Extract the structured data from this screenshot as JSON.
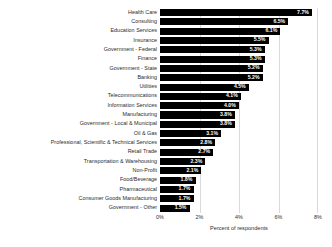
{
  "chart_data": {
    "type": "bar",
    "orientation": "horizontal",
    "title": "",
    "xlabel": "Percent of respondents",
    "ylabel": "",
    "xlim": [
      0,
      8
    ],
    "xticks": [
      "0%",
      "2%",
      "4%",
      "6%",
      "8%"
    ],
    "xtick_values": [
      0,
      2,
      4,
      6,
      8
    ],
    "grid": true,
    "grid_axis": "x",
    "legend": false,
    "bar_color": "#000000",
    "value_label_color": "#ffffff",
    "categories": [
      "Health Care",
      "Consulting",
      "Education Services",
      "Insurance",
      "Government - Federal",
      "Finance",
      "Government - State",
      "Banking",
      "Utilities",
      "Telecommunications",
      "Information Services",
      "Manufacturing",
      "Government - Local & Municipal",
      "Oil & Gas",
      "Professional, Scientific & Technical Services",
      "Retail Trade",
      "Transportation & Warehousing",
      "Non-Profit",
      "Food/Beverage",
      "Pharmaceutical",
      "Consumer Goods Manufacturing",
      "Government - Other"
    ],
    "values": [
      7.7,
      6.5,
      6.1,
      5.5,
      5.3,
      5.3,
      5.2,
      5.2,
      4.5,
      4.1,
      4.0,
      3.8,
      3.8,
      3.1,
      2.8,
      2.7,
      2.3,
      2.1,
      1.8,
      1.7,
      1.7,
      1.5
    ],
    "value_labels": [
      "7.7%",
      "6.5%",
      "6.1%",
      "5.5%",
      "5.3%",
      "5.3%",
      "5.2%",
      "5.2%",
      "4.5%",
      "4.1%",
      "4.0%",
      "3.8%",
      "3.8%",
      "3.1%",
      "2.8%",
      "2.7%",
      "2.3%",
      "2.1%",
      "1.8%",
      "1.7%",
      "1.7%",
      "1.5%"
    ]
  }
}
